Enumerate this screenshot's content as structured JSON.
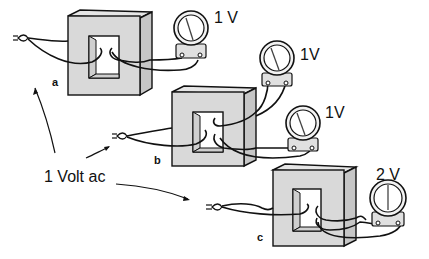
{
  "diagram": {
    "type": "transformer experiment illustration",
    "source_label": "1 Volt ac",
    "setups": [
      {
        "id": "a",
        "label": "a",
        "description": "Transformer core with one primary and one secondary winding loop",
        "meters": [
          {
            "reading": "1 V"
          }
        ]
      },
      {
        "id": "b",
        "label": "b",
        "description": "Transformer core with primary and two separate secondary winding loops",
        "meters": [
          {
            "reading": "1V"
          },
          {
            "reading": "1V"
          }
        ]
      },
      {
        "id": "c",
        "label": "c",
        "description": "Transformer core with primary and a two-turn secondary winding",
        "meters": [
          {
            "reading": "2 V"
          }
        ]
      }
    ]
  },
  "colors": {
    "core": "#d9d9d9",
    "line": "#111111",
    "background": "#ffffff"
  }
}
